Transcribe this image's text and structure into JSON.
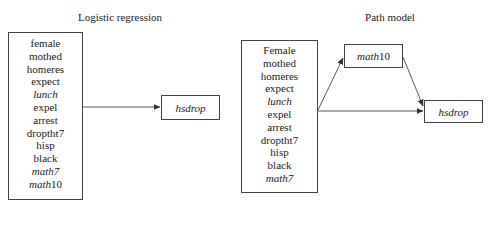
{
  "panels": [
    {
      "title": "Logistic regression",
      "predictors": [
        {
          "name": "female",
          "italic": false
        },
        {
          "name": "mothed",
          "italic": false
        },
        {
          "name": "homeres",
          "italic": false
        },
        {
          "name": "expect",
          "italic": false
        },
        {
          "name": "lunch",
          "italic": true
        },
        {
          "name": "expel",
          "italic": false
        },
        {
          "name": "arrest",
          "italic": false
        },
        {
          "name": "droptht7",
          "italic": false
        },
        {
          "name": "hisp",
          "italic": false
        },
        {
          "name": "black",
          "italic": false
        },
        {
          "name": "math7",
          "italic": true
        },
        {
          "name": "math10",
          "italic_prefix": "math",
          "suffix": "10"
        }
      ],
      "outcome": "hsdrop"
    },
    {
      "title": "Path model",
      "predictors": [
        {
          "name": "Female",
          "italic": false
        },
        {
          "name": "mothed",
          "italic": false
        },
        {
          "name": "homeres",
          "italic": false
        },
        {
          "name": "expect",
          "italic": false
        },
        {
          "name": "lunch",
          "italic": true
        },
        {
          "name": "expel",
          "italic": false
        },
        {
          "name": "arrest",
          "italic": false
        },
        {
          "name": "droptht7",
          "italic": false
        },
        {
          "name": "hisp",
          "italic": false
        },
        {
          "name": "black",
          "italic": false
        },
        {
          "name": "math7",
          "italic": true
        }
      ],
      "mediator": {
        "italic_prefix": "math",
        "suffix": "10"
      },
      "outcome": "hsdrop"
    }
  ],
  "edges": [
    {
      "from": "predictors-left",
      "to": "hsdrop-left"
    },
    {
      "from": "predictors-right",
      "to": "math10"
    },
    {
      "from": "predictors-right",
      "to": "hsdrop-right"
    },
    {
      "from": "math10",
      "to": "hsdrop-right"
    }
  ]
}
